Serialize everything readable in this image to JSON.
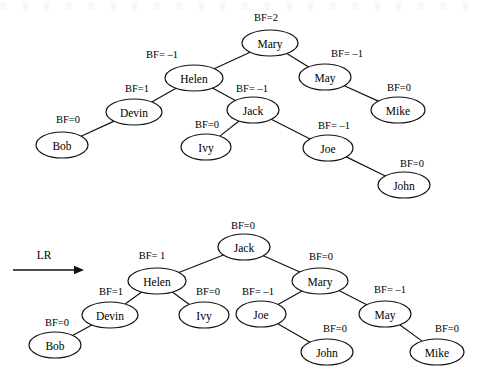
{
  "figure": {
    "caption": "",
    "operation_label": "LR",
    "trees": [
      {
        "id": "before",
        "name": "avl-tree-before-rotation",
        "nodes": [
          {
            "key": "mary",
            "label": "Mary",
            "bf": "BF=2",
            "cx": 270,
            "cy": 43,
            "rx": 28,
            "ry": 13,
            "bf_x": 266,
            "bf_y": 17
          },
          {
            "key": "helen",
            "label": "Helen",
            "bf": "BF= –1",
            "cx": 194,
            "cy": 78,
            "rx": 29,
            "ry": 13,
            "bf_x": 162,
            "bf_y": 54
          },
          {
            "key": "may",
            "label": "May",
            "bf": "BF= –1",
            "cx": 325,
            "cy": 77,
            "rx": 26,
            "ry": 13,
            "bf_x": 347,
            "bf_y": 53
          },
          {
            "key": "devin",
            "label": "Devin",
            "bf": "BF=1",
            "cx": 134,
            "cy": 112,
            "rx": 28,
            "ry": 13,
            "bf_x": 137,
            "bf_y": 88
          },
          {
            "key": "jack",
            "label": "Jack",
            "bf": "BF= –1",
            "cx": 253,
            "cy": 110,
            "rx": 26,
            "ry": 13,
            "bf_x": 252,
            "bf_y": 88
          },
          {
            "key": "mike",
            "label": "Mike",
            "bf": "BF=0",
            "cx": 398,
            "cy": 110,
            "rx": 27,
            "ry": 13,
            "bf_x": 399,
            "bf_y": 87
          },
          {
            "key": "bob",
            "label": "Bob",
            "bf": "BF=0",
            "cx": 62,
            "cy": 145,
            "rx": 26,
            "ry": 13,
            "bf_x": 68,
            "bf_y": 119
          },
          {
            "key": "ivy",
            "label": "Ivy",
            "bf": "BF=0",
            "cx": 206,
            "cy": 147,
            "rx": 25,
            "ry": 13,
            "bf_x": 207,
            "bf_y": 124
          },
          {
            "key": "joe",
            "label": "Joe",
            "bf": "BF= –1",
            "cx": 328,
            "cy": 148,
            "rx": 25,
            "ry": 13,
            "bf_x": 334,
            "bf_y": 125
          },
          {
            "key": "john",
            "label": "John",
            "bf": "BF=0",
            "cx": 404,
            "cy": 185,
            "rx": 26,
            "ry": 13,
            "bf_x": 412,
            "bf_y": 163
          }
        ],
        "edges": [
          {
            "from": "mary",
            "to": "helen"
          },
          {
            "from": "mary",
            "to": "may"
          },
          {
            "from": "helen",
            "to": "devin"
          },
          {
            "from": "helen",
            "to": "jack"
          },
          {
            "from": "may",
            "to": "mike"
          },
          {
            "from": "devin",
            "to": "bob"
          },
          {
            "from": "jack",
            "to": "ivy"
          },
          {
            "from": "jack",
            "to": "joe"
          },
          {
            "from": "joe",
            "to": "john"
          }
        ]
      },
      {
        "id": "after",
        "name": "avl-tree-after-lr-rotation",
        "nodes": [
          {
            "key": "jack",
            "label": "Jack",
            "bf": "BF=0",
            "cx": 244,
            "cy": 247,
            "rx": 26,
            "ry": 13,
            "bf_x": 243,
            "bf_y": 225
          },
          {
            "key": "helen",
            "label": "Helen",
            "bf": "BF= 1",
            "cx": 157,
            "cy": 281,
            "rx": 29,
            "ry": 13,
            "bf_x": 152,
            "bf_y": 255
          },
          {
            "key": "mary",
            "label": "Mary",
            "bf": "BF=0",
            "cx": 320,
            "cy": 281,
            "rx": 28,
            "ry": 13,
            "bf_x": 321,
            "bf_y": 256
          },
          {
            "key": "devin",
            "label": "Devin",
            "bf": "BF=1",
            "cx": 110,
            "cy": 315,
            "rx": 28,
            "ry": 13,
            "bf_x": 111,
            "bf_y": 291
          },
          {
            "key": "ivy",
            "label": "Ivy",
            "bf": "BF=0",
            "cx": 204,
            "cy": 315,
            "rx": 25,
            "ry": 13,
            "bf_x": 208,
            "bf_y": 291
          },
          {
            "key": "joe",
            "label": "Joe",
            "bf": "BF= –1",
            "cx": 261,
            "cy": 314,
            "rx": 25,
            "ry": 13,
            "bf_x": 258,
            "bf_y": 291
          },
          {
            "key": "may",
            "label": "May",
            "bf": "BF= –1",
            "cx": 385,
            "cy": 314,
            "rx": 26,
            "ry": 13,
            "bf_x": 390,
            "bf_y": 289
          },
          {
            "key": "bob",
            "label": "Bob",
            "bf": "BF=0",
            "cx": 55,
            "cy": 345,
            "rx": 26,
            "ry": 13,
            "bf_x": 57,
            "bf_y": 322
          },
          {
            "key": "john",
            "label": "John",
            "bf": "BF=0",
            "cx": 327,
            "cy": 352,
            "rx": 26,
            "ry": 13,
            "bf_x": 335,
            "bf_y": 328
          },
          {
            "key": "mike",
            "label": "Mike",
            "bf": "BF=0",
            "cx": 437,
            "cy": 352,
            "rx": 27,
            "ry": 13,
            "bf_x": 447,
            "bf_y": 328
          }
        ],
        "edges": [
          {
            "from": "jack",
            "to": "helen"
          },
          {
            "from": "jack",
            "to": "mary"
          },
          {
            "from": "helen",
            "to": "devin"
          },
          {
            "from": "helen",
            "to": "ivy"
          },
          {
            "from": "mary",
            "to": "joe"
          },
          {
            "from": "mary",
            "to": "may"
          },
          {
            "from": "devin",
            "to": "bob"
          },
          {
            "from": "joe",
            "to": "john"
          },
          {
            "from": "may",
            "to": "mike"
          }
        ]
      }
    ],
    "arrow": {
      "x1": 13,
      "y1": 270,
      "x2": 84,
      "y2": 270,
      "label_x": 44,
      "label_y": 255
    }
  }
}
